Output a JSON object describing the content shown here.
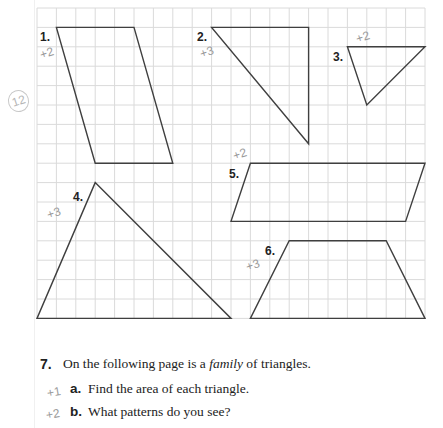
{
  "figure": {
    "grid": {
      "origin_x": 37,
      "origin_y": 8,
      "cell": 19.4,
      "cols": 20,
      "rows": 16,
      "line_color": "#dadada",
      "shape_color": "#3f3f3f"
    },
    "shapes": [
      {
        "id": "1",
        "label": "1.",
        "type": "parallelogram",
        "grid_points": [
          [
            1,
            1
          ],
          [
            5,
            1
          ],
          [
            7,
            8
          ],
          [
            3,
            8
          ]
        ],
        "handwritten_note": "+2"
      },
      {
        "id": "2",
        "label": "2.",
        "type": "right-triangle",
        "grid_points": [
          [
            9,
            1
          ],
          [
            14,
            1
          ],
          [
            14,
            7
          ]
        ],
        "handwritten_note": "+3"
      },
      {
        "id": "3",
        "label": "3.",
        "type": "triangle",
        "grid_points": [
          [
            16,
            2
          ],
          [
            20,
            2
          ],
          [
            17,
            5
          ]
        ],
        "handwritten_note": "+2"
      },
      {
        "id": "4",
        "label": "4.",
        "type": "triangle",
        "grid_points": [
          [
            3,
            9
          ],
          [
            10,
            16
          ],
          [
            0,
            16
          ]
        ],
        "handwritten_note": "+3"
      },
      {
        "id": "5",
        "label": "5.",
        "type": "parallelogram",
        "grid_points": [
          [
            11,
            8
          ],
          [
            20,
            8
          ],
          [
            19,
            11
          ],
          [
            10,
            11
          ]
        ],
        "handwritten_note": "+2"
      },
      {
        "id": "6",
        "label": "6.",
        "type": "trapezoid",
        "grid_points": [
          [
            13,
            12
          ],
          [
            18,
            12
          ],
          [
            20,
            16
          ],
          [
            11,
            16
          ]
        ],
        "handwritten_note": "+3"
      }
    ],
    "margin_note": "12"
  },
  "question": {
    "number": "7.",
    "text_before": "On the following page is a ",
    "text_italic": "family",
    "text_after": " of triangles.",
    "parts": [
      {
        "letter": "a.",
        "text": "Find the area of each triangle.",
        "handwritten_note": "+1"
      },
      {
        "letter": "b.",
        "text": "What patterns do you see?",
        "handwritten_note": "+2"
      }
    ]
  }
}
